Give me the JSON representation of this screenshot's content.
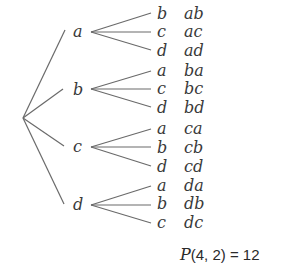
{
  "diagram": {
    "type": "tree",
    "root": "",
    "branches": [
      {
        "label": "a",
        "children": [
          {
            "label": "b",
            "result": "ab"
          },
          {
            "label": "c",
            "result": "ac"
          },
          {
            "label": "d",
            "result": "ad"
          }
        ]
      },
      {
        "label": "b",
        "children": [
          {
            "label": "a",
            "result": "ba"
          },
          {
            "label": "c",
            "result": "bc"
          },
          {
            "label": "d",
            "result": "bd"
          }
        ]
      },
      {
        "label": "c",
        "children": [
          {
            "label": "a",
            "result": "ca"
          },
          {
            "label": "b",
            "result": "cb"
          },
          {
            "label": "d",
            "result": "cd"
          }
        ]
      },
      {
        "label": "d",
        "children": [
          {
            "label": "a",
            "result": "da"
          },
          {
            "label": "b",
            "result": "db"
          },
          {
            "label": "c",
            "result": "dc"
          }
        ]
      }
    ],
    "formula": {
      "function": "P",
      "args": "(4, 2) = 12"
    }
  }
}
